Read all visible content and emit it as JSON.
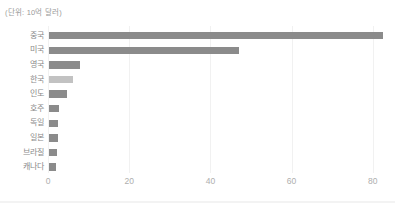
{
  "chart_data": {
    "type": "bar",
    "orientation": "horizontal",
    "title": "",
    "unit_label": "(단위: 10억 달러)",
    "xlabel": "",
    "ylabel": "",
    "categories": [
      "중국",
      "미국",
      "영국",
      "한국",
      "인도",
      "호주",
      "독일",
      "일본",
      "브라질",
      "캐나다"
    ],
    "values": [
      82.3,
      46.9,
      7.8,
      6.1,
      4.6,
      2.6,
      2.3,
      2.3,
      2.0,
      1.8
    ],
    "highlight_category": "한국",
    "xticks": [
      0,
      20,
      40,
      60,
      80
    ],
    "xlim": [
      0,
      85
    ],
    "grid": true,
    "legend": false,
    "colors": {
      "bar": "#8b8b8b",
      "highlight_bar": "#c2c2c2",
      "gridline": "#f1f1f1",
      "category_label": "#8a8a8a",
      "tick_label": "#aeaeae",
      "unit_label": "#999999",
      "background": "#ffffff"
    }
  }
}
